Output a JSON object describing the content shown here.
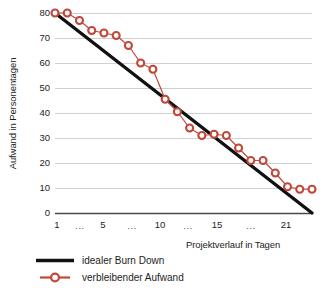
{
  "chart_data": {
    "type": "line",
    "title": "",
    "xlabel": "Projektverlauf in Tagen",
    "ylabel": "Aufwand in Personentagen",
    "xlim": [
      1,
      22
    ],
    "ylim": [
      0,
      80
    ],
    "grid": true,
    "legend_position": "bottom-left",
    "yticks": [
      0,
      10,
      20,
      30,
      40,
      50,
      60,
      70,
      80
    ],
    "xtick_labels": [
      "1",
      "...",
      "5",
      "...",
      "10",
      "...",
      "15",
      "...",
      "21"
    ],
    "xtick_values": [
      1,
      3,
      5,
      7.5,
      10,
      12.5,
      15,
      18,
      21
    ],
    "x": [
      1,
      2,
      3,
      4,
      5,
      6,
      7,
      8,
      9,
      10,
      11,
      12,
      13,
      14,
      15,
      16,
      17,
      18,
      19,
      20,
      21,
      22
    ],
    "series": [
      {
        "name": "idealer Burn Down",
        "type": "line",
        "color": "#111111",
        "marker": "none",
        "linewidth": 3.4,
        "x": [
          1,
          22
        ],
        "values": [
          80,
          0
        ]
      },
      {
        "name": "verbleibender Aufwand",
        "type": "line",
        "color": "#C0483A",
        "marker": "circle",
        "linewidth": 1.2,
        "values": [
          80,
          80,
          77,
          73,
          72,
          71,
          67,
          60,
          57.5,
          45.5,
          40.5,
          34,
          31,
          31.5,
          31,
          26,
          21,
          21,
          16,
          10.5,
          9.5,
          9.5
        ]
      }
    ]
  },
  "legend": {
    "entries": [
      {
        "label": "idealer Burn Down",
        "key": "solid-line-key",
        "color": "#111111"
      },
      {
        "label": "verbleibender Aufwand",
        "key": "line-marker-key",
        "color": "#C0483A"
      }
    ]
  },
  "colors": {
    "ideal": "#111111",
    "remaining": "#C0483A",
    "grid": "#d0d0d0",
    "axis": "#444444",
    "text": "#1d1d1d",
    "background": "#ffffff"
  }
}
